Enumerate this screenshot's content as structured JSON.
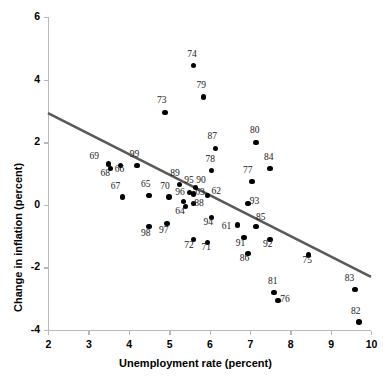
{
  "chart_data": {
    "type": "scatter",
    "title": "",
    "xlabel": "Unemployment rate (percent)",
    "ylabel": "Change in inflation (percent)",
    "xlim": [
      2,
      10
    ],
    "ylim": [
      -4,
      6
    ],
    "xticks": [
      2,
      3,
      4,
      5,
      6,
      7,
      8,
      9,
      10
    ],
    "yticks": [
      -4,
      -2,
      0,
      2,
      4,
      6
    ],
    "xtick_labels": [
      "2",
      "3",
      "4",
      "5",
      "6",
      "7",
      "8",
      "9",
      "10"
    ],
    "ytick_labels": [
      "-4",
      "-2",
      "0",
      "2",
      "4",
      "6"
    ],
    "grid": false,
    "legend": null,
    "point_label_field": "label",
    "points": [
      {
        "label": "61",
        "x": 6.7,
        "y": -0.65,
        "lx": -10,
        "ly": 7
      },
      {
        "label": "62",
        "x": 5.95,
        "y": 0.3,
        "lx": 10,
        "ly": 2
      },
      {
        "label": "63",
        "x": 5.6,
        "y": 0.35,
        "lx": 8,
        "ly": 4
      },
      {
        "label": "64",
        "x": 5.4,
        "y": -0.05,
        "lx": -4,
        "ly": 11
      },
      {
        "label": "65",
        "x": 4.5,
        "y": 0.3,
        "lx": -2,
        "ly": -5
      },
      {
        "label": "66",
        "x": 3.8,
        "y": 1.25,
        "lx": 0,
        "ly": 9
      },
      {
        "label": "67",
        "x": 3.85,
        "y": 0.25,
        "lx": -6,
        "ly": -5
      },
      {
        "label": "68",
        "x": 3.55,
        "y": 1.15,
        "lx": -4,
        "ly": 10
      },
      {
        "label": "69",
        "x": 3.5,
        "y": 1.3,
        "lx": -13,
        "ly": -2
      },
      {
        "label": "70",
        "x": 5.0,
        "y": 0.25,
        "lx": -3,
        "ly": -5
      },
      {
        "label": "71",
        "x": 5.95,
        "y": -1.2,
        "lx": 0,
        "ly": 11
      },
      {
        "label": "72",
        "x": 5.6,
        "y": -1.1,
        "lx": -3,
        "ly": 12
      },
      {
        "label": "73",
        "x": 4.9,
        "y": 2.95,
        "lx": -2,
        "ly": -6
      },
      {
        "label": "74",
        "x": 5.6,
        "y": 4.45,
        "lx": 0,
        "ly": -6
      },
      {
        "label": "75",
        "x": 8.45,
        "y": -1.6,
        "lx": 0,
        "ly": 11
      },
      {
        "label": "76",
        "x": 7.7,
        "y": -3.05,
        "lx": 8,
        "ly": 5
      },
      {
        "label": "77",
        "x": 7.05,
        "y": 0.75,
        "lx": -3,
        "ly": -5
      },
      {
        "label": "78",
        "x": 6.05,
        "y": 1.1,
        "lx": 0,
        "ly": -5
      },
      {
        "label": "79",
        "x": 5.85,
        "y": 3.45,
        "lx": -1,
        "ly": -6
      },
      {
        "label": "80",
        "x": 7.15,
        "y": 2.0,
        "lx": 0,
        "ly": -6
      },
      {
        "label": "81",
        "x": 7.6,
        "y": -2.8,
        "lx": 0,
        "ly": -5
      },
      {
        "label": "82",
        "x": 9.7,
        "y": -3.75,
        "lx": -2,
        "ly": -5
      },
      {
        "label": "83",
        "x": 9.6,
        "y": -2.7,
        "lx": -4,
        "ly": -5
      },
      {
        "label": "84",
        "x": 7.5,
        "y": 1.15,
        "lx": 0,
        "ly": -6
      },
      {
        "label": "85",
        "x": 7.15,
        "y": -0.7,
        "lx": 6,
        "ly": -4
      },
      {
        "label": "86",
        "x": 6.95,
        "y": -1.55,
        "lx": -2,
        "ly": 11
      },
      {
        "label": "87",
        "x": 6.15,
        "y": 1.8,
        "lx": -2,
        "ly": -6
      },
      {
        "label": "88",
        "x": 5.6,
        "y": 0.05,
        "lx": 7,
        "ly": 6
      },
      {
        "label": "89",
        "x": 5.25,
        "y": 0.65,
        "lx": -3,
        "ly": -5
      },
      {
        "label": "90",
        "x": 5.65,
        "y": 0.55,
        "lx": 7,
        "ly": -2
      },
      {
        "label": "91",
        "x": 6.85,
        "y": -1.05,
        "lx": -2,
        "ly": 11
      },
      {
        "label": "92",
        "x": 7.5,
        "y": -1.1,
        "lx": -1,
        "ly": 11
      },
      {
        "label": "93",
        "x": 6.95,
        "y": 0.05,
        "lx": 8,
        "ly": 4
      },
      {
        "label": "94",
        "x": 6.05,
        "y": -0.4,
        "lx": -2,
        "ly": 11
      },
      {
        "label": "95",
        "x": 5.5,
        "y": 0.4,
        "lx": 1,
        "ly": -6
      },
      {
        "label": "96",
        "x": 5.35,
        "y": 0.1,
        "lx": -2,
        "ly": -4
      },
      {
        "label": "97",
        "x": 4.95,
        "y": -0.6,
        "lx": -2,
        "ly": 12
      },
      {
        "label": "98",
        "x": 4.5,
        "y": -0.7,
        "lx": -2,
        "ly": 12
      },
      {
        "label": "99",
        "x": 4.2,
        "y": 1.25,
        "lx": -1,
        "ly": -6
      }
    ],
    "fit_line": {
      "name": "regression-line",
      "x0": 2.0,
      "y0": 2.93,
      "x1": 10.0,
      "y1": -2.3,
      "color": "#595959",
      "width": 2.6
    },
    "colors": {
      "point": "#000000",
      "axis": "#b9b9b9",
      "text": "#000000",
      "background": "#ffffff"
    }
  }
}
